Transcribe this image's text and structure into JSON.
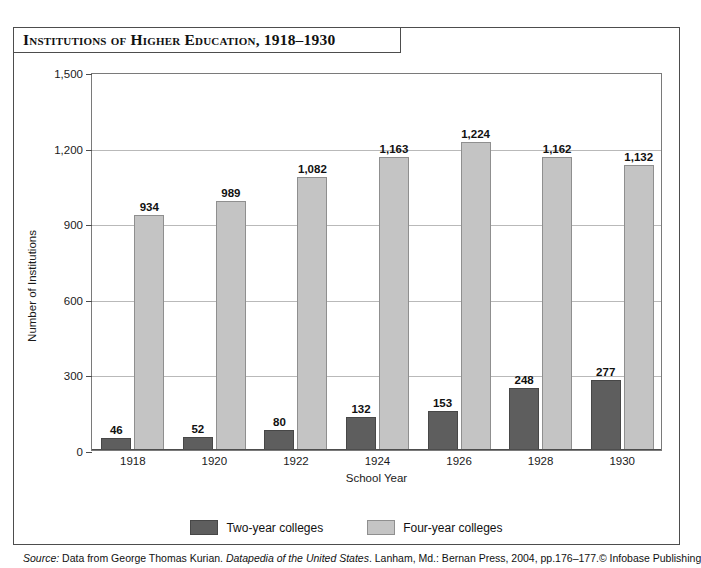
{
  "figure": {
    "title": "Institutions of Higher Education, 1918–1930",
    "source_lead": "Source:",
    "source_pre_title": " Data from George Thomas Kurian. ",
    "source_title": "Datapedia of the United States",
    "source_post_title": ". Lanham, Md.: Bernan Press, 2004, pp.176–177.",
    "copyright": "© Infobase Publishing"
  },
  "colors": {
    "two_year": "#5e5e5e",
    "four_year": "#c4c4c4",
    "axis": "#4d4d4d",
    "grid": "#b9b9b9",
    "text": "#111111"
  },
  "chart_data": {
    "type": "bar",
    "title": "Institutions of Higher Education, 1918–1930",
    "xlabel": "School Year",
    "ylabel": "Number of Institutions",
    "categories": [
      "1918",
      "1920",
      "1922",
      "1924",
      "1926",
      "1928",
      "1930"
    ],
    "series": [
      {
        "name": "Two-year colleges",
        "color": "#5e5e5e",
        "values": [
          46,
          52,
          80,
          132,
          153,
          248,
          277
        ],
        "labels": [
          "46",
          "52",
          "80",
          "132",
          "153",
          "248",
          "277"
        ]
      },
      {
        "name": "Four-year colleges",
        "color": "#c4c4c4",
        "values": [
          934,
          989,
          1082,
          1163,
          1224,
          1162,
          1132
        ],
        "labels": [
          "934",
          "989",
          "1,082",
          "1,163",
          "1,224",
          "1,162",
          "1,132"
        ]
      }
    ],
    "ylim": [
      0,
      1500
    ],
    "yticks": [
      0,
      300,
      600,
      900,
      1200,
      1500
    ],
    "ytick_labels": [
      "0",
      "300",
      "600",
      "900",
      "1,200",
      "1,500"
    ],
    "grid": "horizontal",
    "legend_position": "bottom-center"
  }
}
